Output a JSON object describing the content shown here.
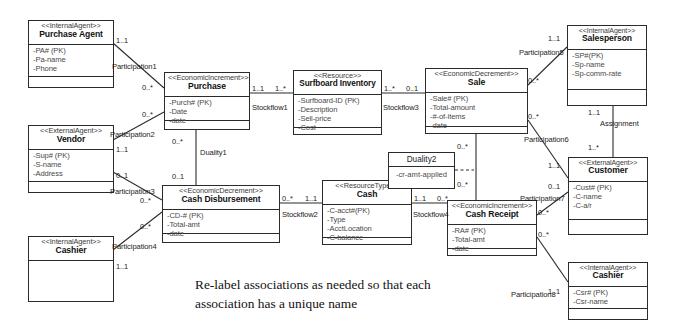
{
  "diagram": {
    "caption_line1": "Re-label associations as needed so that each",
    "caption_line2": "association has a unique name",
    "classes": [
      {
        "id": "purchase-agent",
        "stereotype": "<<InternalAgent>>",
        "name": "Purchase Agent",
        "attributes": [
          "-PA# (PK)",
          "-Pa-name",
          "-Phone"
        ]
      },
      {
        "id": "vendor",
        "stereotype": "<<ExternalAgent>>",
        "name": "Vendor",
        "attributes": [
          "-Sup# (PK)",
          "-S-name",
          "-Address"
        ]
      },
      {
        "id": "cashier-left",
        "stereotype": "<<InternalAgent>>",
        "name": "Cashier",
        "attributes": []
      },
      {
        "id": "purchase",
        "stereotype": "<<EconomicIncrement>>",
        "name": "Purchase",
        "attributes": [
          "-Purch# (PK)",
          "-Date",
          "-date"
        ]
      },
      {
        "id": "cash-disbursement",
        "stereotype": "<<EconomicDecrement>>",
        "name": "Cash Disbursement",
        "attributes": [
          "-CD-# (PK)",
          "-Total-amt",
          "-date"
        ]
      },
      {
        "id": "surfboard-inventory",
        "stereotype": "<<Resource>>",
        "name": "Surfboard Inventory",
        "attributes": [
          "-Surfboard-ID (PK)",
          "-Description",
          "-Sell-price",
          "-Cost"
        ]
      },
      {
        "id": "cash",
        "stereotype": "<<ResourceType>>",
        "name": "Cash",
        "attributes": [
          "-C-acct#(PK)",
          "-Type",
          "-AcctLocation",
          "-C-balance"
        ]
      },
      {
        "id": "sale",
        "stereotype": "<<EconomicDecrement>>",
        "name": "Sale",
        "attributes": [
          "-Sale# (PK)",
          "-Total-amount",
          "-#-of-items",
          "-date"
        ]
      },
      {
        "id": "cash-receipt",
        "stereotype": "<<EconomicIncrement>>",
        "name": "Cash Receipt",
        "attributes": [
          "-RA# (PK)",
          "-Total-amt",
          "-date"
        ]
      },
      {
        "id": "salesperson",
        "stereotype": "<<InternalAgent>>",
        "name": "Salesperson",
        "attributes": [
          "-SP#(PK)",
          "-Sp-name",
          "-Sp-comm-rate"
        ]
      },
      {
        "id": "customer",
        "stereotype": "<<ExternalAgent>>",
        "name": "Customer",
        "attributes": [
          "-Cust# (PK)",
          "-C-name",
          "-C-a/r"
        ]
      },
      {
        "id": "cashier-right",
        "stereotype": "<<InternalAgent>>",
        "name": "Cashier",
        "attributes": [
          "-Csr# (PK)",
          "-Csr-name"
        ]
      }
    ],
    "association_classes": [
      {
        "id": "duality1",
        "name": "Duality1",
        "attribute": ""
      },
      {
        "id": "duality2",
        "name": "Duality2",
        "attribute": "-cr-amt-applied"
      }
    ],
    "associations": [
      {
        "id": "participation1",
        "label": "Participation1"
      },
      {
        "id": "participation2",
        "label": "Participation2"
      },
      {
        "id": "participation3",
        "label": "Participation3"
      },
      {
        "id": "participation4",
        "label": "Participation4"
      },
      {
        "id": "participation5",
        "label": "Participation5"
      },
      {
        "id": "participation6",
        "label": "Participation6"
      },
      {
        "id": "participation7",
        "label": "Participation7"
      },
      {
        "id": "participation8",
        "label": "Participation8"
      },
      {
        "id": "stockflow1",
        "label": "Stockflow1"
      },
      {
        "id": "stockflow2",
        "label": "Stockflow2"
      },
      {
        "id": "stockflow3",
        "label": "Stockflow3"
      },
      {
        "id": "stockflow4",
        "label": "Stockflow4"
      },
      {
        "id": "duality1-label",
        "label": "Duality1"
      },
      {
        "id": "assignment",
        "label": "Assignment"
      }
    ],
    "multiplicities": [
      {
        "id": "m-pa-1",
        "value": "1..1"
      },
      {
        "id": "m-purchase-pa",
        "value": "0..*"
      },
      {
        "id": "m-purchase-vendor",
        "value": "0..*"
      },
      {
        "id": "m-vendor-1",
        "value": "1..1"
      },
      {
        "id": "m-vendor-2",
        "value": "0..1"
      },
      {
        "id": "m-cd-vendor",
        "value": "0..*"
      },
      {
        "id": "m-cd-cashier",
        "value": "0..*"
      },
      {
        "id": "m-cashier-left",
        "value": "1..1"
      },
      {
        "id": "m-purchase-sf1",
        "value": "1..1"
      },
      {
        "id": "m-inv-sf1",
        "value": "1..*"
      },
      {
        "id": "m-inv-sf3",
        "value": "1..*"
      },
      {
        "id": "m-sale-sf3",
        "value": "0..1"
      },
      {
        "id": "m-purchase-dual",
        "value": "0..*"
      },
      {
        "id": "m-cd-dual",
        "value": "0..1"
      },
      {
        "id": "m-cd-sf2",
        "value": "0..*"
      },
      {
        "id": "m-cash-sf2",
        "value": "1..1"
      },
      {
        "id": "m-cash-sf4",
        "value": "1..1"
      },
      {
        "id": "m-cr-sf4",
        "value": "0..*"
      },
      {
        "id": "m-sale-dual2",
        "value": "0..*"
      },
      {
        "id": "m-cr-dual2",
        "value": "0..*"
      },
      {
        "id": "m-sale-sp",
        "value": "0..*"
      },
      {
        "id": "m-sp-1",
        "value": "1..1"
      },
      {
        "id": "m-sale-cust",
        "value": "0..*"
      },
      {
        "id": "m-cust-1",
        "value": "1..1"
      },
      {
        "id": "m-cr-cust",
        "value": "0..*"
      },
      {
        "id": "m-cust-2",
        "value": "0..1"
      },
      {
        "id": "m-cr-cashier",
        "value": "0..*"
      },
      {
        "id": "m-cashier-right",
        "value": "1..1"
      },
      {
        "id": "m-sp-assign",
        "value": "1..1"
      },
      {
        "id": "m-cust-assign",
        "value": "1..*"
      }
    ]
  }
}
